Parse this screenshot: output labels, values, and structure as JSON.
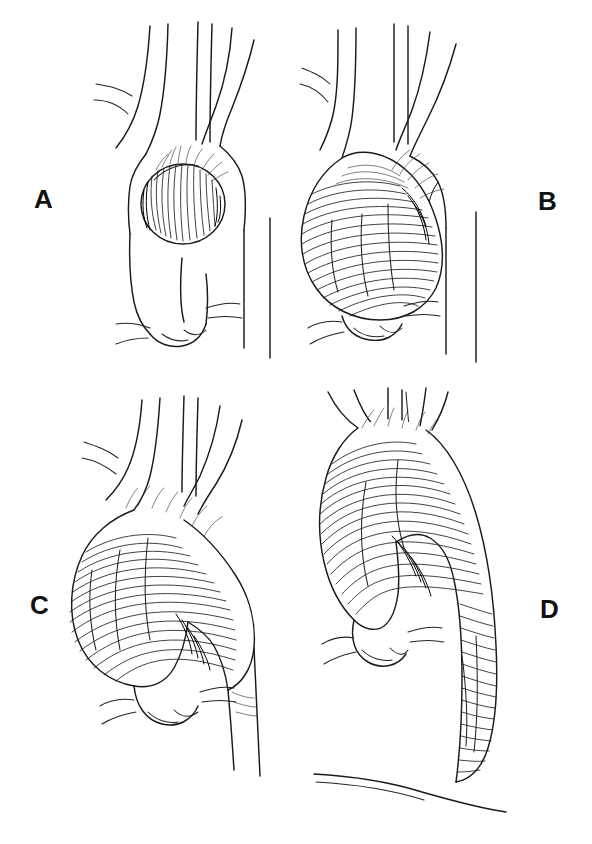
{
  "figure": {
    "medium": "pen-and-ink line drawing",
    "background_color": "#ffffff",
    "ink_color": "#1a1a1a",
    "layout": "2x2 grid of anatomical panels with outer letter labels",
    "panel_count": 4
  },
  "panels": [
    {
      "id": "a",
      "label": "A",
      "label_position": "left",
      "subject": "Small saccular aneurysm arising from the ascending aorta",
      "shading": "dense vertical hatching with dark rim shadow",
      "structures": [
        "brachiocephalic artery with bifurcation",
        "left common carotid artery",
        "left subclavian artery",
        "aortic arch",
        "ascending aorta",
        "descending thoracic aorta",
        "aortic root with sinuses of Valsalva",
        "coronary artery ostia"
      ]
    },
    {
      "id": "b",
      "label": "B",
      "label_position": "right",
      "subject": "Large fusiform aneurysm of the ascending aorta sparing the arch",
      "shading": "curved horizontal hatching following the bulge contour",
      "structures": [
        "brachiocephalic artery with bifurcation",
        "left common carotid artery",
        "left subclavian artery",
        "aortic arch",
        "dilated ascending aorta",
        "descending thoracic aorta",
        "aortic root with sinuses of Valsalva",
        "coronary artery ostia"
      ]
    },
    {
      "id": "c",
      "label": "C",
      "label_position": "left",
      "subject": "Aneurysm of ascending aorta extending into the aortic arch",
      "shading": "sweeping horizontal hatching over arch and ascending segment",
      "structures": [
        "brachiocephalic artery with bifurcation",
        "left common carotid artery",
        "left subclavian artery",
        "dilated aortic arch",
        "dilated ascending aorta",
        "descending thoracic aorta",
        "aortic root with sinuses of Valsalva",
        "coronary artery ostia"
      ]
    },
    {
      "id": "d",
      "label": "D",
      "label_position": "right",
      "subject": "Extensive aneurysm involving ascending aorta, arch and descending thoracic aorta",
      "shading": "continuous transverse hatching along the entire dilated aorta",
      "structures": [
        "brachiocephalic artery",
        "left common carotid artery",
        "left subclavian artery",
        "dilated aortic arch",
        "dilated ascending aorta",
        "dilated descending thoracic aorta",
        "aortic root with sinuses of Valsalva",
        "coronary artery ostia",
        "diaphragm"
      ]
    }
  ]
}
